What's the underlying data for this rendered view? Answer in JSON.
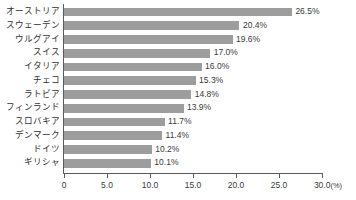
{
  "chart_data": {
    "type": "bar",
    "orientation": "horizontal",
    "title": "",
    "subtitle": "",
    "xlabel": "",
    "ylabel": "",
    "unit": "(%)",
    "xlim": [
      0,
      30.0
    ],
    "xticks": [
      "0",
      "5.0",
      "10.0",
      "15.0",
      "20.0",
      "25.0",
      "30.0"
    ],
    "xtick_values": [
      0,
      5,
      10,
      15,
      20,
      25,
      30
    ],
    "grid": false,
    "legend": false,
    "legend_position": "none",
    "bar_color": "#9d9d9d",
    "axis_color": "#5a5a5a",
    "text_color": "#3a3a3a",
    "categories": [
      "オーストリア",
      "スウェーデン",
      "ウルグアイ",
      "スイス",
      "イタリア",
      "チェコ",
      "ラトビア",
      "フィンランド",
      "スロバキア",
      "デンマーク",
      "ドイツ",
      "ギリシャ"
    ],
    "values": [
      26.5,
      20.4,
      19.6,
      17.0,
      16.0,
      15.3,
      14.8,
      13.9,
      11.7,
      11.4,
      10.2,
      10.1
    ],
    "data_labels": [
      "26.5%",
      "20.4%",
      "19.6%",
      "17.0%",
      "16.0%",
      "15.3%",
      "14.8%",
      "13.9%",
      "11.7%",
      "11.4%",
      "10.2%",
      "10.1%"
    ]
  }
}
